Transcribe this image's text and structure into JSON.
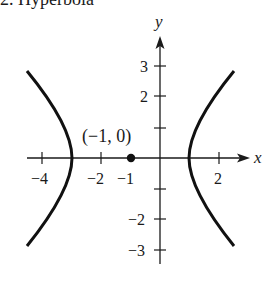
{
  "heading": "2. Hyperbola",
  "axes": {
    "x_label": "x",
    "y_label": "y",
    "x_ticks": [
      {
        "value": -4,
        "label": "−4",
        "px": 42
      },
      {
        "value": -2,
        "label": "−2",
        "px": 101
      },
      {
        "value": -1,
        "label": "−1",
        "px": 131
      },
      {
        "value": 2,
        "label": "2",
        "px": 219
      }
    ],
    "y_ticks": [
      {
        "value": 3,
        "label": "3",
        "py": 66
      },
      {
        "value": 2,
        "label": "2",
        "py": 96
      },
      {
        "value": 1,
        "label": "",
        "py": 128
      },
      {
        "value": -1,
        "label": "",
        "py": 189
      },
      {
        "value": -2,
        "label": "−2",
        "py": 219
      },
      {
        "value": -3,
        "label": "−3",
        "py": 250
      }
    ]
  },
  "point": {
    "label": "(−1, 0)",
    "x": -1,
    "y": 0
  },
  "curve": {
    "type": "hyperbola",
    "equation": "(x+1)^2/4 - y^2/4 = 1",
    "center": [
      -1,
      0
    ],
    "vertices": [
      [
        -3,
        0
      ],
      [
        1,
        0
      ]
    ],
    "color": "#111111"
  }
}
